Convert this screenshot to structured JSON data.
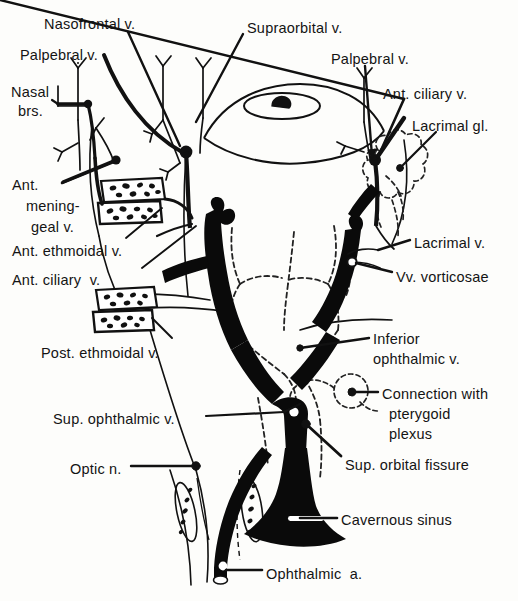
{
  "figure": {
    "domain": "anatomical-line-diagram",
    "colors": {
      "ink": "#111111",
      "background": "#fdfdfb",
      "vein_fill": "#000000",
      "dashed_stroke": "#333333"
    }
  },
  "labels": [
    {
      "id": "nasofrontal-v",
      "text": "Nasofrontal v.",
      "x": 44,
      "y": 16,
      "align": "left"
    },
    {
      "id": "palpebral-v-left",
      "text": "Palpebral v.",
      "x": 20,
      "y": 47,
      "align": "left"
    },
    {
      "id": "nasal-brs-line1",
      "text": "Nasal",
      "x": 11,
      "y": 84,
      "align": "left"
    },
    {
      "id": "nasal-brs-line2",
      "text": "brs.",
      "x": 18,
      "y": 103,
      "align": "left"
    },
    {
      "id": "supraorbital-v",
      "text": "Supraorbital v.",
      "x": 247,
      "y": 20,
      "align": "left"
    },
    {
      "id": "palpebral-v-right",
      "text": "Palpebral v.",
      "x": 331,
      "y": 51,
      "align": "left"
    },
    {
      "id": "ant-ciliary-v-right",
      "text": "Ant. ciliary v.",
      "x": 383,
      "y": 86,
      "align": "left"
    },
    {
      "id": "lacrimal-gl",
      "text": "Lacrimal gl.",
      "x": 412,
      "y": 118,
      "align": "left"
    },
    {
      "id": "ant-mening-line1",
      "text": "Ant.",
      "x": 12,
      "y": 177,
      "align": "left"
    },
    {
      "id": "ant-mening-line2",
      "text": "mening-",
      "x": 26,
      "y": 198,
      "align": "left"
    },
    {
      "id": "ant-mening-line3",
      "text": "geal v.",
      "x": 31,
      "y": 219,
      "align": "left"
    },
    {
      "id": "ant-ethmoidal-v",
      "text": "Ant. ethmoidal v.",
      "x": 12,
      "y": 243,
      "align": "left"
    },
    {
      "id": "ant-ciliary-v-left",
      "text": "Ant. ciliary  v.",
      "x": 12,
      "y": 272,
      "align": "left"
    },
    {
      "id": "lacrimal-v",
      "text": "Lacrimal v.",
      "x": 414,
      "y": 235,
      "align": "left"
    },
    {
      "id": "vv-vorticosae",
      "text": "Vv. vorticosae",
      "x": 396,
      "y": 269,
      "align": "left"
    },
    {
      "id": "post-ethmoidal-v",
      "text": "Post. ethmoidal v.",
      "x": 41,
      "y": 345,
      "align": "left"
    },
    {
      "id": "inferior-oph-line1",
      "text": "Inferior",
      "x": 373,
      "y": 331,
      "align": "left"
    },
    {
      "id": "inferior-oph-line2",
      "text": "ophthalmic v.",
      "x": 373,
      "y": 351,
      "align": "left"
    },
    {
      "id": "connection-line1",
      "text": "Connection with",
      "x": 382,
      "y": 386,
      "align": "left"
    },
    {
      "id": "connection-line2",
      "text": "pterygoid",
      "x": 389,
      "y": 406,
      "align": "left"
    },
    {
      "id": "connection-line3",
      "text": "plexus",
      "x": 389,
      "y": 426,
      "align": "left"
    },
    {
      "id": "sup-ophthalmic-v",
      "text": "Sup. ophthalmic v.",
      "x": 53,
      "y": 411,
      "align": "left"
    },
    {
      "id": "sup-orbital-fissure",
      "text": "Sup. orbital fissure",
      "x": 345,
      "y": 457,
      "align": "left"
    },
    {
      "id": "optic-n",
      "text": "Optic n.",
      "x": 70,
      "y": 461,
      "align": "left"
    },
    {
      "id": "cavernous-sinus",
      "text": "Cavernous sinus",
      "x": 341,
      "y": 512,
      "align": "left"
    },
    {
      "id": "ophthalmic-a",
      "text": "Ophthalmic  a.",
      "x": 266,
      "y": 566,
      "align": "left"
    }
  ],
  "structures": [
    {
      "id": "eye-globe",
      "name": "eye-globe-outline",
      "kind": "outline"
    },
    {
      "id": "iris",
      "name": "iris-outline",
      "kind": "outline"
    },
    {
      "id": "pupil",
      "name": "pupil",
      "kind": "filled"
    },
    {
      "id": "lacrimal-gland",
      "name": "lacrimal-gland-lobules",
      "kind": "dashed"
    },
    {
      "id": "cavernous-sinus",
      "name": "cavernous-sinus-body",
      "kind": "filled"
    },
    {
      "id": "sup-ophthalmic-vein",
      "name": "superior-ophthalmic-vein",
      "kind": "filled"
    },
    {
      "id": "inf-ophthalmic-vein",
      "name": "inferior-ophthalmic-vein",
      "kind": "filled"
    },
    {
      "id": "ophthalmic-artery",
      "name": "ophthalmic-artery",
      "kind": "filled"
    },
    {
      "id": "ethmoid-cells-upper",
      "name": "ethmoid-air-cells-upper",
      "kind": "outline"
    },
    {
      "id": "ethmoid-cells-lower",
      "name": "ethmoid-air-cells-lower",
      "kind": "outline"
    },
    {
      "id": "pterygoid-connection",
      "name": "pterygoid-plexus-loop",
      "kind": "dashed"
    },
    {
      "id": "vorticose-veins",
      "name": "vorticose-veins",
      "kind": "dashed"
    },
    {
      "id": "orbit-walls",
      "name": "orbital-wall-outlines",
      "kind": "outline"
    }
  ]
}
